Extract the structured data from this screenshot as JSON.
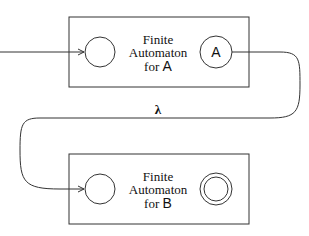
{
  "diagram": {
    "top_box": {
      "line1": "Finite",
      "line2": "Automaton",
      "line3_prefix": "for ",
      "line3_symbol": "A",
      "final_state_label": "A"
    },
    "bottom_box": {
      "line1": "Finite",
      "line2": "Automaton",
      "line3_prefix": "for ",
      "line3_symbol": "B"
    },
    "transition_label": "λ",
    "colors": {
      "stroke": "#333333",
      "text": "#111111",
      "background": "#ffffff"
    }
  }
}
